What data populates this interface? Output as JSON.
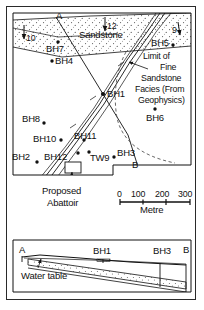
{
  "figure": {
    "type": "geological-map-and-cross-section",
    "panels": [
      "plan-map",
      "cross-section"
    ]
  },
  "map": {
    "unit_label": "Sandstone",
    "limit_note_lines": [
      "Limit of",
      "Fine",
      "Sandstone",
      "Facies (From",
      "Geophysics)"
    ],
    "dip_arrows": [
      {
        "value": "10",
        "name": "dip-arrow-10"
      },
      {
        "value": "12",
        "name": "dip-arrow-12"
      },
      {
        "value": "9",
        "name": "dip-arrow-9"
      }
    ],
    "section_line": {
      "start": "A",
      "end": "B"
    },
    "boreholes": [
      {
        "id": "BH7"
      },
      {
        "id": "BH4"
      },
      {
        "id": "BH1"
      },
      {
        "id": "BH5"
      },
      {
        "id": "BH6"
      },
      {
        "id": "BH8"
      },
      {
        "id": "BH10"
      },
      {
        "id": "BH11"
      },
      {
        "id": "BH2"
      },
      {
        "id": "BH12"
      },
      {
        "id": "TW9"
      },
      {
        "id": "BH3"
      }
    ],
    "site": {
      "label_lines": [
        "Proposed",
        "Abattoir"
      ]
    }
  },
  "scalebar": {
    "ticks": [
      "0",
      "100",
      "200",
      "300"
    ],
    "units": "Metre"
  },
  "section": {
    "left_end": "A",
    "right_end": "B",
    "markers": [
      "BH1",
      "BH3"
    ],
    "water_table_label": "Water table"
  },
  "colors": {
    "ink": "#111111",
    "stipple": "#5a5a5a",
    "dashed": "#555555"
  }
}
